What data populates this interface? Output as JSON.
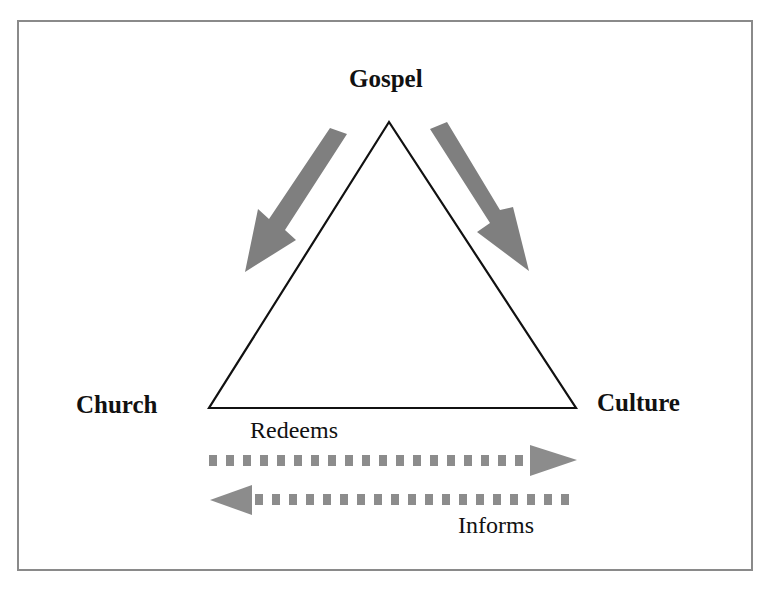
{
  "figure": {
    "caption_visible": false
  },
  "nodes": {
    "top": "Gospel",
    "left": "Church",
    "right": "Culture"
  },
  "relations": {
    "church_to_culture": "Redeems",
    "culture_to_church": "Informs"
  },
  "colors": {
    "triangle_stroke": "#111111",
    "arrow_fill": "#808080",
    "dash_fill": "#8c8c8c",
    "frame_border": "#8a8a8a",
    "text": "#111111"
  },
  "geometry": {
    "triangle": {
      "apex": [
        389,
        122
      ],
      "left": [
        209,
        408
      ],
      "right": [
        576,
        408
      ]
    }
  }
}
